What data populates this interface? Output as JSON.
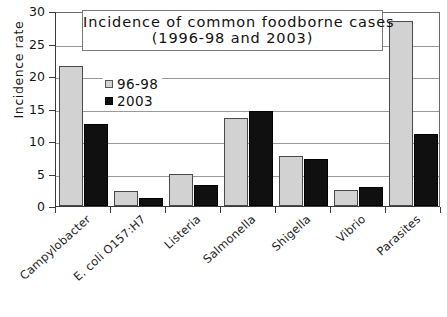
{
  "chart_data": {
    "type": "bar",
    "title": "Incidence of common foodborne cases (1996-98 and 2003)",
    "title_line1": "Incidence of common foodborne cases",
    "title_line2": "(1996-98 and 2003)",
    "xlabel": "",
    "ylabel": "Incidence  rate",
    "ylim": [
      0,
      30
    ],
    "ytick_step": 5,
    "yticks": [
      "0",
      "5",
      "10",
      "15",
      "20",
      "25",
      "30"
    ],
    "grid": true,
    "legend_position": "inside-upper-left",
    "categories": [
      "Campylobacter",
      "E. coli O157:H7",
      "Listeria",
      "Salmonella",
      "Shigella",
      "Vibrio",
      "Parasites"
    ],
    "series": [
      {
        "name": "96-98",
        "color": "#d2d2d2",
        "values": [
          21.6,
          2.3,
          5.0,
          13.6,
          7.7,
          2.4,
          28.5
        ]
      },
      {
        "name": "2003",
        "color": "#101010",
        "values": [
          12.6,
          1.2,
          3.3,
          14.7,
          7.2,
          3.0,
          11.1
        ]
      }
    ]
  },
  "legend": {
    "items": [
      {
        "label": "96-98",
        "swatch": "light-gray-square"
      },
      {
        "label": "2003",
        "swatch": "black-square"
      }
    ]
  }
}
